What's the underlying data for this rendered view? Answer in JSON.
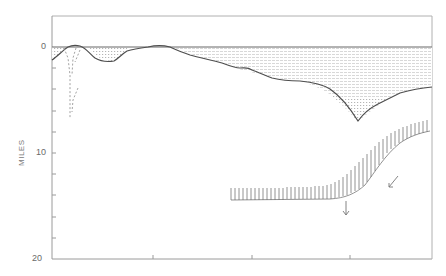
{
  "figure": {
    "type": "cross-section diagram",
    "y_axis": {
      "label": "MILES",
      "tick_labels": [
        "0",
        "10",
        "20"
      ],
      "range": [
        0,
        20
      ],
      "minor_ticks_per_interval": 5
    },
    "x_axis": {
      "tick_count": 3,
      "tick_labels": []
    },
    "colors": {
      "frame": "#9a9a9a",
      "profile_line": "#555555",
      "shading": "#bdbdbd",
      "label": "#6a6a6a"
    },
    "elements": [
      {
        "name": "sea-level-line",
        "depth_miles": 0
      },
      {
        "name": "seafloor-profile",
        "deepest_point_miles": 6.8
      },
      {
        "name": "water-shading",
        "description": "stippled region between sea level and seafloor"
      },
      {
        "name": "dashed-conduit",
        "description": "dashed V-shaped feature near left edge, to ~7 miles"
      },
      {
        "name": "hatched-boundary",
        "description": "hatched subducting slab boundary from ~14.5 to ~7.5 miles"
      },
      {
        "name": "motion-arrows",
        "count": 2,
        "description": "downward-pointing arrows below hatched boundary"
      }
    ]
  }
}
